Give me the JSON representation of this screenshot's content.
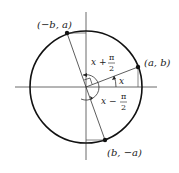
{
  "diagram": {
    "type": "unit-circle-rotation",
    "points": {
      "p1": {
        "label": "(a, b)"
      },
      "p2": {
        "label": "(−b, a)"
      },
      "p3": {
        "label": "(b, −a)"
      }
    },
    "angles": {
      "x": {
        "label": "x"
      },
      "plus": {
        "prefix": "x +",
        "num": "π",
        "den": "2"
      },
      "minus": {
        "prefix": "x −",
        "num": "π",
        "den": "2"
      }
    },
    "colors": {
      "stroke": "#222222",
      "background": "#ffffff"
    }
  }
}
